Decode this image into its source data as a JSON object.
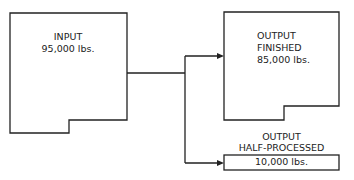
{
  "diagram": {
    "input": {
      "title": "INPUT",
      "value": "95,000 lbs."
    },
    "output_finished": {
      "title": "OUTPUT",
      "subtitle": "FINISHED",
      "value": "85,000 lbs."
    },
    "output_half": {
      "title": "OUTPUT",
      "subtitle": "HALF-PROCESSED",
      "value": "10,000 lbs."
    },
    "colors": {
      "line": "#222222",
      "background": "#ffffff"
    }
  }
}
